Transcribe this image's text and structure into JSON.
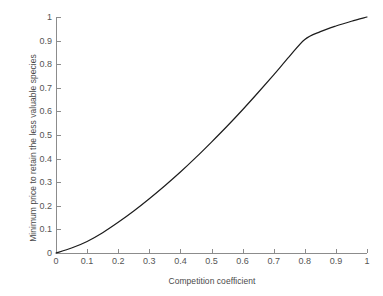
{
  "chart_data": {
    "type": "line",
    "title": "",
    "subtitle": "",
    "xlabel": "Competition coefficient",
    "ylabel": "Minimum price to retain the less valuable species",
    "xlim": [
      0,
      1
    ],
    "ylim": [
      0,
      1
    ],
    "grid": false,
    "legend": null,
    "annotations": [],
    "xticks": [
      "0",
      "0.1",
      "0.2",
      "0.3",
      "0.4",
      "0.5",
      "0.6",
      "0.7",
      "0.8",
      "0.9",
      "1"
    ],
    "xtick_values": [
      0,
      0.1,
      0.2,
      0.3,
      0.4,
      0.5,
      0.6,
      0.7,
      0.8,
      0.9,
      1
    ],
    "yticks": [
      "0",
      "0.1",
      "0.2",
      "0.3",
      "0.4",
      "0.5",
      "0.6",
      "0.7",
      "0.8",
      "0.9",
      "1"
    ],
    "ytick_values": [
      0,
      0.1,
      0.2,
      0.3,
      0.4,
      0.5,
      0.6,
      0.7,
      0.8,
      0.9,
      1
    ],
    "series": [
      {
        "name": "Minimum price",
        "color": "#1c1c1c",
        "linewidth": 1.2,
        "x": [
          0.0,
          0.05,
          0.1,
          0.15,
          0.2,
          0.25,
          0.3,
          0.35,
          0.4,
          0.45,
          0.5,
          0.55,
          0.6,
          0.65,
          0.7,
          0.75,
          0.8,
          0.85,
          0.9,
          0.95,
          1.0
        ],
        "y": [
          0.0,
          0.021,
          0.049,
          0.086,
          0.13,
          0.178,
          0.23,
          0.285,
          0.343,
          0.405,
          0.47,
          0.537,
          0.607,
          0.68,
          0.755,
          0.832,
          0.905,
          0.938,
          0.962,
          0.982,
          1.0
        ]
      }
    ]
  },
  "axes": {
    "line_color": "#8c8c8c",
    "tick_label_color": "#555555",
    "axis_title_color": "#4a4a4a"
  }
}
